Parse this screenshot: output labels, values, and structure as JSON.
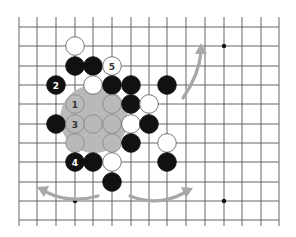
{
  "diagram": {
    "type": "go-board-fragment",
    "grid": {
      "columns_x": [
        19,
        37,
        56,
        75,
        93,
        112,
        131,
        149,
        167,
        186,
        205,
        224,
        242,
        261,
        279
      ],
      "rows_y": [
        27,
        46,
        66,
        85,
        104,
        124,
        143,
        162,
        182,
        201,
        220
      ],
      "line_color": "#555555",
      "stub_top": 17,
      "stub_bottom": 226
    },
    "star_points": [
      {
        "col": 11,
        "row": 1
      },
      {
        "col": 11,
        "row": 9
      },
      {
        "col": 3,
        "row": 9
      }
    ],
    "highlight_area": {
      "cx": 94,
      "cy": 119,
      "r": 34,
      "color": "#b9b9b9"
    },
    "stones": [
      {
        "color": "white",
        "col": 3,
        "row": 1,
        "label": ""
      },
      {
        "color": "black",
        "col": 3,
        "row": 2,
        "label": ""
      },
      {
        "color": "black",
        "col": 4,
        "row": 2,
        "label": ""
      },
      {
        "color": "white",
        "col": 5,
        "row": 2,
        "label": "5"
      },
      {
        "color": "black",
        "col": 2,
        "row": 3,
        "label": "2"
      },
      {
        "color": "white",
        "col": 4,
        "row": 3,
        "label": ""
      },
      {
        "color": "black",
        "col": 5,
        "row": 3,
        "label": ""
      },
      {
        "color": "black",
        "col": 6,
        "row": 3,
        "label": ""
      },
      {
        "color": "black",
        "col": 8,
        "row": 3,
        "label": ""
      },
      {
        "color": "ghost",
        "col": 3,
        "row": 4,
        "label": "1"
      },
      {
        "color": "ghost",
        "col": 5,
        "row": 4,
        "label": ""
      },
      {
        "color": "black",
        "col": 6,
        "row": 4,
        "label": ""
      },
      {
        "color": "white",
        "col": 7,
        "row": 4,
        "label": ""
      },
      {
        "color": "black",
        "col": 2,
        "row": 5,
        "label": ""
      },
      {
        "color": "ghost",
        "col": 3,
        "row": 5,
        "label": "3"
      },
      {
        "color": "ghost",
        "col": 4,
        "row": 5,
        "label": ""
      },
      {
        "color": "ghost",
        "col": 5,
        "row": 5,
        "label": ""
      },
      {
        "color": "white",
        "col": 6,
        "row": 5,
        "label": ""
      },
      {
        "color": "black",
        "col": 7,
        "row": 5,
        "label": ""
      },
      {
        "color": "ghost",
        "col": 3,
        "row": 6,
        "label": ""
      },
      {
        "color": "ghost",
        "col": 5,
        "row": 6,
        "label": ""
      },
      {
        "color": "black",
        "col": 6,
        "row": 6,
        "label": ""
      },
      {
        "color": "white",
        "col": 8,
        "row": 6,
        "label": ""
      },
      {
        "color": "black",
        "col": 3,
        "row": 7,
        "label": "4"
      },
      {
        "color": "black",
        "col": 4,
        "row": 7,
        "label": ""
      },
      {
        "color": "white",
        "col": 5,
        "row": 7,
        "label": ""
      },
      {
        "color": "black",
        "col": 8,
        "row": 7,
        "label": ""
      },
      {
        "color": "black",
        "col": 5,
        "row": 8,
        "label": ""
      }
    ],
    "arrows": [
      {
        "name": "arrow-upper-right",
        "path": "M183 98 Q199 75 201 52",
        "tip": [
          201,
          43
        ],
        "dir": "up"
      },
      {
        "name": "arrow-lower-left",
        "path": "M98 196 Q70 204 46 192",
        "tip": [
          37,
          187
        ],
        "dir": "left"
      },
      {
        "name": "arrow-lower-right",
        "path": "M130 196 Q158 207 184 193",
        "tip": [
          193,
          188
        ],
        "dir": "right"
      }
    ],
    "colors": {
      "black_stone": "#111111",
      "white_stone": "#ffffff",
      "stone_outline": "#666666",
      "ghost_stone": "#b9b9b9",
      "arrow": "#a8a8a8"
    }
  }
}
